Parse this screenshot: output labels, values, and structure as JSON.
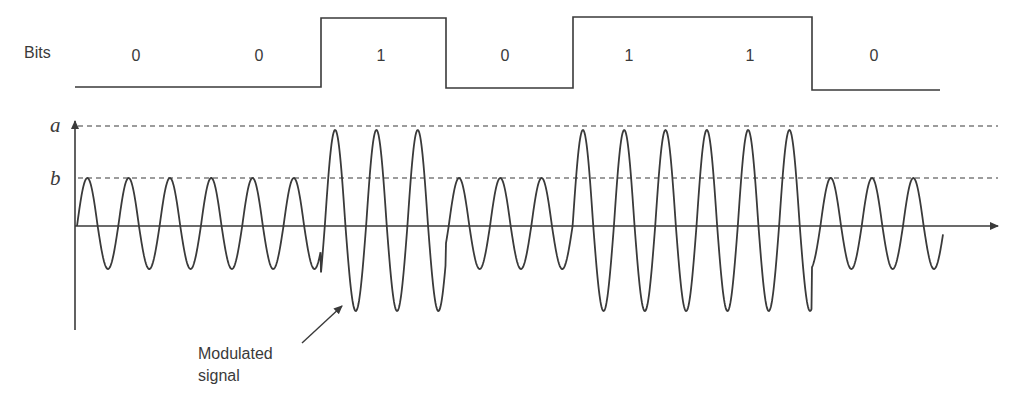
{
  "diagram": {
    "title_label": "Bits",
    "bits": [
      "0",
      "0",
      "1",
      "0",
      "1",
      "1",
      "0"
    ],
    "bit_boundaries_x": [
      75,
      197,
      321,
      446,
      573,
      696,
      812,
      940
    ],
    "levels": {
      "a_label": "a",
      "b_label": "b"
    },
    "signal_label_line1": "Modulated",
    "signal_label_line2": "signal",
    "colors": {
      "stroke": "#3a3a3a",
      "background": "#ffffff"
    },
    "modulation": "Amplitude Shift Keying (ASK)",
    "amplitude_for_bit_0": "b",
    "amplitude_for_bit_1": "a",
    "cycles_per_bit": 3
  }
}
